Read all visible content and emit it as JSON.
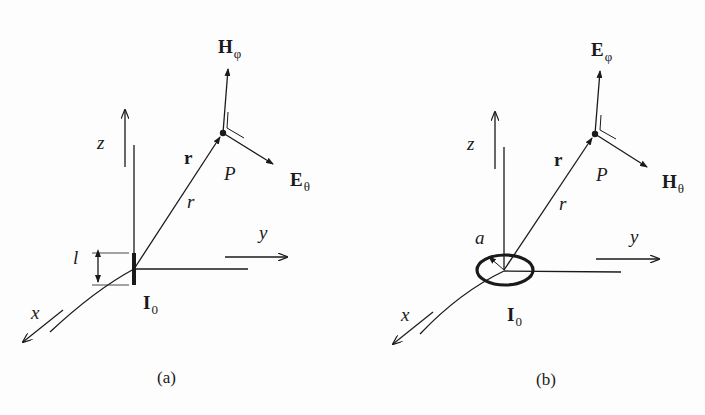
{
  "figure": {
    "panels": [
      {
        "id": "a",
        "caption": "(a)",
        "source": "electric dipole",
        "axes": {
          "x": "x",
          "y": "y",
          "z": "z"
        },
        "labels": {
          "position_vector": "r",
          "distance": "r",
          "point": "P",
          "length": "l",
          "current_main": "I",
          "current_sub": "0",
          "vertical_field_main": "H",
          "vertical_field_sub": "φ",
          "side_field_main": "E",
          "side_field_sub": "θ"
        }
      },
      {
        "id": "b",
        "caption": "(b)",
        "source": "magnetic loop dipole",
        "axes": {
          "x": "x",
          "y": "y",
          "z": "z"
        },
        "labels": {
          "position_vector": "r",
          "distance": "r",
          "point": "P",
          "radius": "a",
          "current_main": "I",
          "current_sub": "0",
          "vertical_field_main": "E",
          "vertical_field_sub": "φ",
          "side_field_main": "H",
          "side_field_sub": "θ"
        }
      }
    ],
    "colors": {
      "ink": "#1a1a1a",
      "background": "#fdfdfd"
    }
  }
}
